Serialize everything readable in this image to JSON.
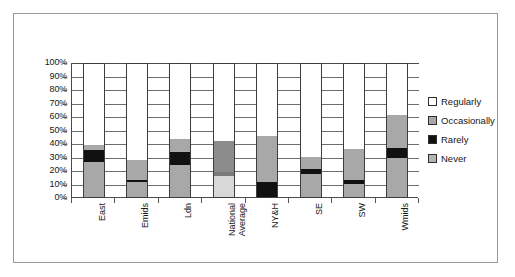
{
  "chart_data": {
    "type": "bar",
    "subtype": "100% stacked column",
    "title": "",
    "subtitle": "",
    "xlabel": "",
    "ylabel": "",
    "ylim": [
      0,
      100
    ],
    "ytick_labels": [
      "100%",
      "90%",
      "80%",
      "70%",
      "60%",
      "50%",
      "40%",
      "30%",
      "20%",
      "10%",
      "0%"
    ],
    "ytick_values": [
      100,
      90,
      80,
      70,
      60,
      50,
      40,
      30,
      20,
      10,
      0
    ],
    "grid": true,
    "legend_position": "right",
    "stack_order_bottom_to_top": [
      "Never",
      "Rarely",
      "Occasionally",
      "Regularly"
    ],
    "categories": [
      "East",
      "Emids",
      "Ldn",
      "National Average",
      "NY&H",
      "SE",
      "SW",
      "Wmids"
    ],
    "series": [
      {
        "name": "Never",
        "values": [
          26,
          11,
          24,
          16,
          0,
          17,
          10,
          29
        ]
      },
      {
        "name": "Rarely",
        "values": [
          9,
          2,
          10,
          3,
          11,
          4,
          3,
          8
        ]
      },
      {
        "name": "Occasionally",
        "values": [
          4,
          15,
          10,
          23,
          35,
          9,
          23,
          25
        ]
      },
      {
        "name": "Regularly",
        "values": [
          61,
          72,
          56,
          58,
          54,
          70,
          64,
          38
        ]
      }
    ],
    "series_colors": {
      "Never": "#b4b4b4",
      "Rarely": "#111111",
      "Occasionally": "#a8a8a8",
      "Regularly": "#ffffff"
    },
    "legend_entries": [
      "Regularly",
      "Occasionally",
      "Rarely",
      "Never"
    ]
  },
  "legend": {
    "items": [
      {
        "label": "Regularly",
        "swatch": "regularly"
      },
      {
        "label": "Occasionally",
        "swatch": "occasionally"
      },
      {
        "label": "Rarely",
        "swatch": "rarely"
      },
      {
        "label": "Never",
        "swatch": "never"
      }
    ]
  },
  "xlabels": [
    {
      "text": "East"
    },
    {
      "text": "Emids"
    },
    {
      "text": "Ldn"
    },
    {
      "text": "National Average"
    },
    {
      "text": "NY&H"
    },
    {
      "text": "SE"
    },
    {
      "text": "SW"
    },
    {
      "text": "Wmids"
    }
  ]
}
